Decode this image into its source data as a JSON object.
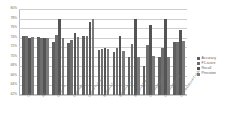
{
  "chart_data": {
    "type": "bar",
    "title": "",
    "subtitle": "",
    "xlabel": "",
    "ylabel": "",
    "ylim": [
      62,
      80
    ],
    "ytick_labels": [
      "80%",
      "78%",
      "76%",
      "74%",
      "72%",
      "70%",
      "68%",
      "66%",
      "64%",
      "62%"
    ],
    "ytick_values": [
      80,
      78,
      76,
      74,
      72,
      70,
      68,
      66,
      64,
      62
    ],
    "grid": true,
    "legend_position": "right",
    "categories": [
      "LR",
      "RF",
      "CNN+FT",
      "CNN+Adv",
      "CNN+FT+Adv",
      "BiGRU+FT",
      "BiGRU+Adv",
      "BiGRU+FT+Adv",
      "CNN-BiGRU+FT",
      "CNN-BiGRU+Adv",
      "CNN-BiGRU+FT+Adv"
    ],
    "series": [
      {
        "name": "Accuracy",
        "color": "#5f5f5f",
        "values": [
          74.3,
          74.1,
          73.0,
          72.8,
          74.4,
          71.5,
          71.0,
          70.0,
          68.0,
          69.9,
          73.0
        ]
      },
      {
        "name": "F1-score",
        "color": "#6e6e6e",
        "values": [
          74.4,
          74.0,
          74.5,
          73.5,
          74.3,
          71.7,
          71.8,
          72.6,
          72.5,
          71.9,
          73.2
        ]
      },
      {
        "name": "Recall",
        "color": "#545454",
        "values": [
          74.0,
          74.0,
          78.0,
          74.9,
          77.2,
          71.9,
          74.4,
          78.0,
          76.6,
          78.0,
          75.6
        ]
      },
      {
        "name": "Precision",
        "color": "#7b7b7b",
        "values": [
          74.2,
          74.0,
          74.0,
          74.1,
          78.0,
          71.6,
          71.2,
          70.0,
          70.1,
          70.0,
          73.4
        ]
      }
    ]
  },
  "legend": {
    "items": [
      {
        "label": "Accuracy"
      },
      {
        "label": "F1-score"
      },
      {
        "label": "Recall"
      },
      {
        "label": "Precision"
      }
    ]
  },
  "colors": {
    "accuracy": "#5f5f5f",
    "f1_score": "#6e6e6e",
    "recall": "#545454",
    "precision": "#7b7b7b",
    "gridline": "#cfcfcf",
    "axis": "#b9b9b9",
    "tick_text": "#6f6f6f"
  }
}
